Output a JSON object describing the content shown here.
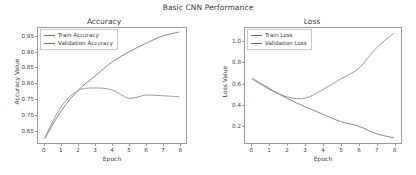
{
  "figure": {
    "suptitle": "Basic CNN Performance",
    "background": "#ffffff",
    "line_color_train": "#6f6f6f",
    "line_color_validation": "#8a8a8a",
    "frame_color": "#9a9a9a",
    "text_color": "#3b3b3b"
  },
  "chart_data": [
    {
      "type": "line",
      "title": "Accuracy",
      "xlabel": "Epoch",
      "ylabel": "Accuracy Value",
      "x": [
        0,
        1,
        2,
        3,
        4,
        5,
        6,
        7,
        8
      ],
      "xlim": [
        -0.4,
        8.4
      ],
      "ylim": [
        0.608,
        0.978
      ],
      "xticks": [
        "0",
        "1",
        "2",
        "3",
        "4",
        "5",
        "6",
        "7",
        "8"
      ],
      "yticks": [
        "0.65",
        "0.70",
        "0.75",
        "0.80",
        "0.85",
        "0.90",
        "0.95"
      ],
      "ytick_values": [
        0.65,
        0.7,
        0.75,
        0.8,
        0.85,
        0.9,
        0.95
      ],
      "grid": false,
      "legend_position": "upper left",
      "series": [
        {
          "name": "Train Accuracy",
          "color": "#6f6f6f",
          "values": [
            0.622,
            0.713,
            0.778,
            0.824,
            0.868,
            0.901,
            0.928,
            0.952,
            0.965
          ]
        },
        {
          "name": "Validation Accuracy",
          "color": "#8a8a8a",
          "values": [
            0.625,
            0.727,
            0.777,
            0.785,
            0.779,
            0.752,
            0.762,
            0.76,
            0.757
          ]
        }
      ]
    },
    {
      "type": "line",
      "title": "Loss",
      "xlabel": "Epoch",
      "ylabel": "Loss Value",
      "x": [
        0,
        1,
        2,
        3,
        4,
        5,
        6,
        7,
        8
      ],
      "xlim": [
        -0.4,
        8.4
      ],
      "ylim": [
        0.035,
        1.13
      ],
      "xticks": [
        "0",
        "1",
        "2",
        "3",
        "4",
        "5",
        "6",
        "7",
        "8"
      ],
      "yticks": [
        "0.2",
        "0.4",
        "0.6",
        "0.8",
        "1.0"
      ],
      "ytick_values": [
        0.2,
        0.4,
        0.6,
        0.8,
        1.0
      ],
      "grid": false,
      "legend_position": "upper left",
      "series": [
        {
          "name": "Train Loss",
          "color": "#6f6f6f",
          "values": [
            0.652,
            0.552,
            0.458,
            0.38,
            0.308,
            0.238,
            0.196,
            0.124,
            0.085
          ]
        },
        {
          "name": "Validation Loss",
          "color": "#8a8a8a",
          "values": [
            0.645,
            0.543,
            0.473,
            0.462,
            0.545,
            0.645,
            0.743,
            0.938,
            1.082
          ]
        }
      ]
    }
  ]
}
